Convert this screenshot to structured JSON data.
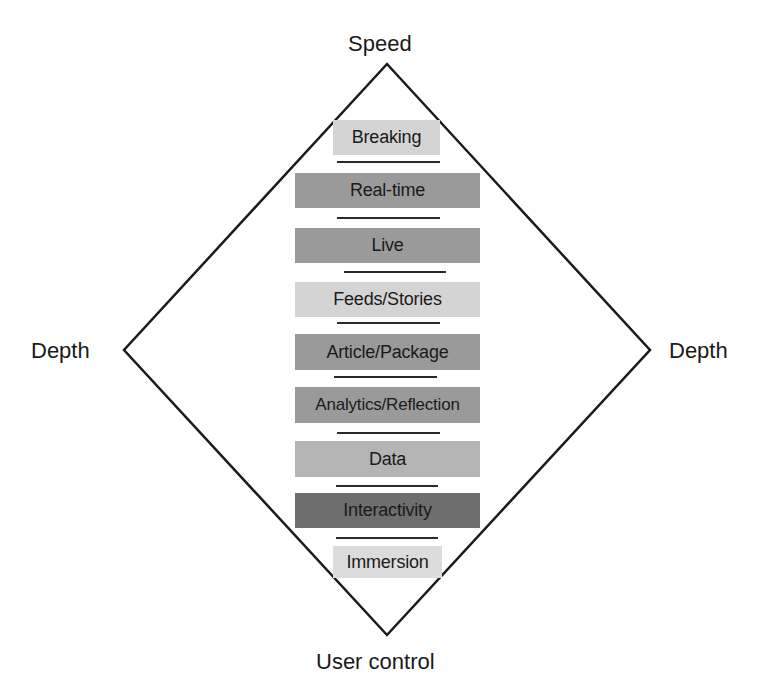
{
  "diagram": {
    "title": "",
    "axes": {
      "top": "Speed",
      "bottom": "User control",
      "left": "Depth",
      "right": "Depth"
    },
    "layers": [
      {
        "label": "Breaking",
        "shade": "#d4d4d4"
      },
      {
        "label": "Real-time",
        "shade": "#9a9a9a"
      },
      {
        "label": "Live",
        "shade": "#9a9a9a"
      },
      {
        "label": "Feeds/Stories",
        "shade": "#d4d4d4"
      },
      {
        "label": "Article/Package",
        "shade": "#9a9a9a"
      },
      {
        "label": "Analytics/Reflection",
        "shade": "#9a9a9a"
      },
      {
        "label": "Data",
        "shade": "#b4b4b4"
      },
      {
        "label": "Interactivity",
        "shade": "#6e6e6e"
      },
      {
        "label": "Immersion",
        "shade": "#dcdcdc"
      }
    ],
    "colors": {
      "outline": "#1a1a1a",
      "separator": "#2a2a2a",
      "text": "#1a1a1a",
      "background": "#ffffff"
    }
  }
}
